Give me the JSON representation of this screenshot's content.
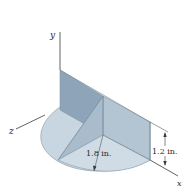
{
  "figure": {
    "axes": {
      "x_label": "x",
      "y_label": "y",
      "z_label": "z"
    },
    "dimensions": {
      "radius_label": "1.8 in.",
      "height_label": "1.2 in."
    },
    "colors": {
      "vertical_plate": "#8ea4b8",
      "triangle_left_face": "#a9bccb",
      "triangle_right_face": "#b8cad6",
      "base_disc": "#c7d6e0",
      "edge": "#7d8f9d",
      "axis_line": "#3a3a3a",
      "background": "#ffffff"
    }
  }
}
